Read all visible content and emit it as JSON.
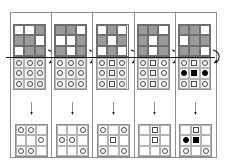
{
  "figure": {
    "title": "",
    "panel_count": 5,
    "colors": {
      "dark_cell": "#9a9a9a",
      "light_cell": "#ffffff",
      "token_stroke": "#4a4a4a",
      "token_filled": "#000000",
      "panel_border": "#8e8e8e",
      "arrow": "#1a1a1a"
    },
    "icons": {
      "rotate_arrow": "curved-arrow-icon",
      "down_arrow": "down-arrow-icon"
    }
  },
  "panels": [
    {
      "id": "panel-1",
      "color_grid": [
        [
          "light",
          "light",
          "dark"
        ],
        [
          "dark",
          "dark",
          "light"
        ],
        [
          "light",
          "dark",
          "dark"
        ]
      ],
      "token_grid": [
        [
          "circle",
          "circle",
          "circle"
        ],
        [
          "circle",
          "circle",
          "circle"
        ],
        [
          "circle",
          "circle",
          "circle"
        ]
      ],
      "result_grid": [
        [
          "circle",
          "circle",
          "none"
        ],
        [
          "none",
          "none",
          "circle"
        ],
        [
          "circle",
          "circle",
          "none"
        ]
      ]
    },
    {
      "id": "panel-2",
      "color_grid": [
        [
          "dark",
          "dark",
          "light"
        ],
        [
          "light",
          "light",
          "dark"
        ],
        [
          "dark",
          "light",
          "dark"
        ]
      ],
      "token_grid": [
        [
          "circle",
          "circle",
          "circle"
        ],
        [
          "circle",
          "circle",
          "circle"
        ],
        [
          "circle",
          "circle",
          "circle"
        ]
      ],
      "result_grid": [
        [
          "none",
          "none",
          "circle"
        ],
        [
          "circle",
          "circle",
          "none"
        ],
        [
          "none",
          "none",
          "circle"
        ]
      ]
    },
    {
      "id": "panel-3",
      "color_grid": [
        [
          "light",
          "dark",
          "light"
        ],
        [
          "dark",
          "light",
          "dark"
        ],
        [
          "light",
          "dark",
          "light"
        ]
      ],
      "token_grid": [
        [
          "circle",
          "square",
          "circle"
        ],
        [
          "circle",
          "square",
          "circle"
        ],
        [
          "circle",
          "square",
          "circle"
        ]
      ],
      "result_grid": [
        [
          "circle",
          "none",
          "circle"
        ],
        [
          "none",
          "square",
          "none"
        ],
        [
          "circle",
          "none",
          "circle"
        ]
      ]
    },
    {
      "id": "panel-4",
      "color_grid": [
        [
          "dark",
          "dark",
          "light"
        ],
        [
          "dark",
          "light",
          "dark"
        ],
        [
          "dark",
          "light",
          "dark"
        ]
      ],
      "token_grid": [
        [
          "circle",
          "square",
          "circle"
        ],
        [
          "circle",
          "square",
          "circle"
        ],
        [
          "circle",
          "square",
          "circle"
        ]
      ],
      "result_grid": [
        [
          "none",
          "square",
          "none"
        ],
        [
          "none",
          "square",
          "none"
        ],
        [
          "none",
          "none",
          "circle"
        ]
      ]
    },
    {
      "id": "panel-5",
      "color_grid": [
        [
          "dark",
          "dark",
          "light"
        ],
        [
          "light",
          "dark",
          "dark"
        ],
        [
          "dark",
          "dark",
          "light"
        ]
      ],
      "token_grid": [
        [
          "circle",
          "square",
          "circle"
        ],
        [
          "circle-filled",
          "square-filled",
          "circle-filled"
        ],
        [
          "circle",
          "square",
          "circle"
        ]
      ],
      "result_grid": [
        [
          "none",
          "square",
          "none"
        ],
        [
          "circle-filled",
          "square-filled",
          "none"
        ],
        [
          "circle",
          "none",
          "circle"
        ]
      ]
    }
  ]
}
